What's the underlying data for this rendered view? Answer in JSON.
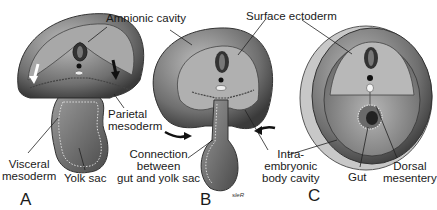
{
  "figure": {
    "panels": [
      {
        "id": "A",
        "letter": "A"
      },
      {
        "id": "B",
        "letter": "B"
      },
      {
        "id": "C",
        "letter": "C"
      }
    ],
    "labels": {
      "amnionic_cavity": "Amnionic cavity",
      "surface_ectoderm": "Surface ectoderm",
      "parietal_mesoderm": "Parietal\nmesoderm",
      "visceral_mesoderm": "Visceral\nmesoderm",
      "yolk_sac": "Yolk sac",
      "connection": "Connection\nbetween\ngut and yolk sac",
      "intraembryonic_body_cavity": "Intra-\nembryonic\nbody cavity",
      "gut": "Gut",
      "dorsal_mesentery": "Dorsal\nmesentery"
    },
    "signature": "sleR",
    "colors": {
      "background": "#ffffff",
      "outer_shell": "#6e6e6e",
      "amnion_fill": "#a9a9a9",
      "yolk_fill": "#8a8a8a",
      "dark": "#2a2a2a",
      "light": "#e6e6e6"
    }
  }
}
